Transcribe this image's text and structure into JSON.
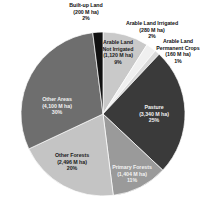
{
  "chart_data": {
    "type": "pie",
    "title": "",
    "subtitle": "",
    "xlabel": "",
    "ylabel": "",
    "legend_position": "none",
    "grid": false,
    "units": "M ha",
    "total_percent": 100,
    "categories": [
      "Arable Land Not Irrigated",
      "Arable Land Irrigated",
      "Arable Land Permanent Crops",
      "Pasture",
      "Primary Forests",
      "Other Forests",
      "Other Areas",
      "Built-up Land"
    ],
    "values": [
      1120,
      280,
      160,
      3340,
      1404,
      2496,
      4100,
      200
    ],
    "percents": [
      9,
      2,
      1,
      25,
      11,
      20,
      30,
      2
    ],
    "colors": [
      "#c9c9c9",
      "#f0f0f0",
      "#d8d8d8",
      "#3a3a3a",
      "#9a9a9a",
      "#c4c4c4",
      "#6e6e6e",
      "#111111"
    ],
    "slices": [
      {
        "name": "Arable Land Not Irrigated",
        "value": 1120,
        "percent": 9,
        "color": "#c9c9c9",
        "label_lines": [
          "Arable Land",
          "Not Irrigated",
          "(1,120  M ha)",
          "9%"
        ]
      },
      {
        "name": "Arable Land Irrigated",
        "value": 280,
        "percent": 2,
        "color": "#f0f0f0",
        "label_lines": [
          "Arable Land Irrigated",
          "(280 M ha)",
          "2%"
        ]
      },
      {
        "name": "Arable Land Permanent Crops",
        "value": 160,
        "percent": 1,
        "color": "#d8d8d8",
        "label_lines": [
          "Arable Land",
          "Permanent Crops",
          "(160 M ha)",
          "1%"
        ]
      },
      {
        "name": "Pasture",
        "value": 3340,
        "percent": 25,
        "color": "#3a3a3a",
        "label_lines": [
          "Pasture",
          "(3,340 M ha)",
          "25%"
        ]
      },
      {
        "name": "Primary Forests",
        "value": 1404,
        "percent": 11,
        "color": "#9a9a9a",
        "label_lines": [
          "Primary Forests",
          "(1,404  M ha)",
          "11%"
        ]
      },
      {
        "name": "Other Forests",
        "value": 2496,
        "percent": 20,
        "color": "#c4c4c4",
        "label_lines": [
          "Other Forests",
          "(2,496  M ha)",
          "20%"
        ]
      },
      {
        "name": "Other Areas",
        "value": 4100,
        "percent": 30,
        "color": "#6e6e6e",
        "label_lines": [
          "Other Areas",
          "(4,100 M ha)",
          "30%"
        ]
      },
      {
        "name": "Built-up Land",
        "value": 200,
        "percent": 2,
        "color": "#111111",
        "label_lines": [
          "Built-up Land",
          "(200 M ha)",
          "2%"
        ]
      }
    ]
  },
  "labels": {
    "builtup": {
      "l1": "Built-up Land",
      "l2": "(200 M ha)",
      "l3": "2%"
    },
    "irrigated": {
      "l1": "Arable Land Irrigated",
      "l2": "(280 M ha)",
      "l3": "2%"
    },
    "permanent": {
      "l1": "Arable Land",
      "l2": "Permanent Crops",
      "l3": "(160 M ha)",
      "l4": "1%"
    },
    "notirrigated": {
      "l1": "Arable Land",
      "l2": "Not Irrigated",
      "l3": "(1,120  M ha)",
      "l4": "9%"
    },
    "pasture": {
      "l1": "Pasture",
      "l2": "(3,340 M ha)",
      "l3": "25%"
    },
    "primary": {
      "l1": "Primary Forests",
      "l2": "(1,404  M ha)",
      "l3": "11%"
    },
    "otherforests": {
      "l1": "Other Forests",
      "l2": "(2,496  M ha)",
      "l3": "20%"
    },
    "otherareas": {
      "l1": "Other Areas",
      "l2": "(4,100 M ha)",
      "l3": "30%"
    }
  }
}
